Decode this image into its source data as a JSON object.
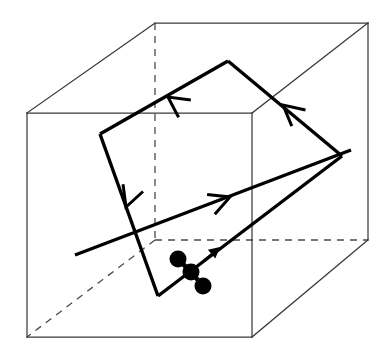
{
  "figure": {
    "type": "line-diagram",
    "width": 388,
    "height": 357,
    "background_color": "#ffffff",
    "colors": {
      "cube_solid_stroke": "#3a3a3a",
      "cube_hidden_stroke": "#4a4a4a",
      "loop_stroke": "#000000",
      "axis_stroke": "#000000",
      "atom_fill": "#000000"
    }
  },
  "cube": {
    "name": "cubic-cell",
    "projection": "oblique",
    "vertices": {
      "front_top_left": [
        27,
        113
      ],
      "front_top_right": [
        252,
        113
      ],
      "front_bottom_left": [
        27,
        337
      ],
      "front_bottom_right": [
        252,
        337
      ],
      "back_top_left": [
        155,
        23
      ],
      "back_top_right": [
        368,
        23
      ],
      "back_bottom_left": [
        155,
        240
      ],
      "back_bottom_right": [
        368,
        240
      ]
    },
    "solid_edges": [
      [
        "front_top_left",
        "front_top_right"
      ],
      [
        "front_top_right",
        "front_bottom_right"
      ],
      [
        "front_bottom_right",
        "front_bottom_left"
      ],
      [
        "front_bottom_left",
        "front_top_left"
      ],
      [
        "back_top_left",
        "back_top_right"
      ],
      [
        "back_top_right",
        "back_bottom_right"
      ],
      [
        "front_top_left",
        "back_top_left"
      ],
      [
        "front_top_right",
        "back_top_right"
      ],
      [
        "front_bottom_right",
        "back_bottom_right"
      ]
    ],
    "hidden_edges": [
      [
        "back_top_left",
        "back_bottom_left"
      ],
      [
        "back_bottom_left",
        "back_bottom_right"
      ],
      [
        "back_bottom_left",
        "front_bottom_left"
      ]
    ]
  },
  "loop": {
    "name": "oriented-quadrilateral-loop",
    "closed": true,
    "orientation": "counter-clockwise-in-projection",
    "vertices": {
      "top": [
        228,
        61
      ],
      "right": [
        342,
        156
      ],
      "bottom": [
        158,
        296
      ],
      "left": [
        100,
        134
      ]
    },
    "edge_order": [
      "top",
      "left",
      "bottom",
      "right"
    ],
    "arrow_markers": [
      {
        "id": "arrow-top-left-edge",
        "at": [
          168,
          97
        ],
        "direction_deg": 215,
        "on_edge": "top-to-left"
      },
      {
        "id": "arrow-left-bottom-edge",
        "at": [
          126,
          207
        ],
        "direction_deg": 110,
        "on_edge": "left-to-bottom"
      },
      {
        "id": "arrow-right-top-edge",
        "at": [
          283,
          105
        ],
        "direction_deg": 220,
        "on_edge": "right-to-top"
      }
    ]
  },
  "axis": {
    "name": "directed-axis-line",
    "start": [
      75,
      255
    ],
    "end": [
      351,
      150
    ],
    "arrow_marker": {
      "id": "arrow-axis",
      "at": [
        230,
        197
      ],
      "direction_deg": 339
    }
  },
  "molecule": {
    "name": "three-atom-molecule",
    "atom_count": 3,
    "atom_radius": 8.5,
    "atoms": [
      {
        "id": "atom-upper-left",
        "position": [
          178,
          259
        ]
      },
      {
        "id": "atom-center",
        "position": [
          191,
          272
        ]
      },
      {
        "id": "atom-lower-right",
        "position": [
          203,
          286
        ]
      }
    ],
    "bonds": [
      {
        "from": "atom-upper-left",
        "to": "atom-center"
      },
      {
        "from": "atom-center",
        "to": "atom-lower-right"
      }
    ],
    "moment_arrow": {
      "id": "magnetic-moment-arrow",
      "from": [
        193,
        270
      ],
      "to": [
        220,
        247
      ],
      "head_length": 11
    }
  }
}
